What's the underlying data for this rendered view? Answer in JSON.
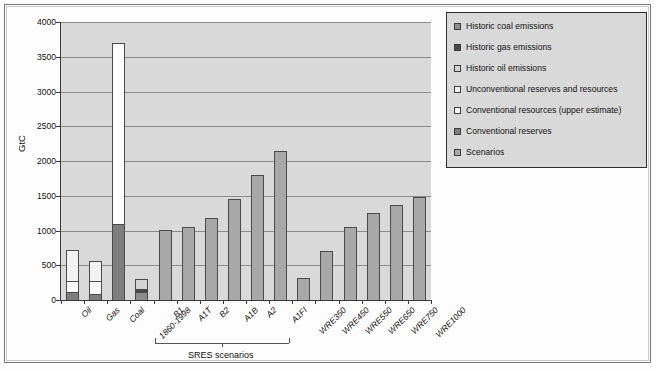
{
  "figure": {
    "axis_title": "GtC",
    "group_brace_label": "SRES scenarios"
  },
  "chart_data": {
    "type": "bar",
    "title": "",
    "xlabel": "",
    "ylabel": "GtC",
    "ylim": [
      0,
      4000
    ],
    "ytick_step": 500,
    "ytick_labels": [
      "4000",
      "3500",
      "3000",
      "2500",
      "2000",
      "1500",
      "1000",
      "500",
      "0"
    ],
    "grid": true,
    "stacked": true,
    "legend_position": "right",
    "legend": [
      {
        "label": "Historic coal emissions",
        "color": "#8c8c8c"
      },
      {
        "label": "Historic gas emissions",
        "color": "#4a4a4a"
      },
      {
        "label": "Historic oil emissions",
        "color": "#d4d4d4"
      },
      {
        "label": "Unconventional reserves and resources",
        "color": "#f2f2f2"
      },
      {
        "label": "Conventional resources (upper estimate)",
        "color": "#ffffff"
      },
      {
        "label": "Conventional reserves",
        "color": "#7e7e7e"
      },
      {
        "label": "Scenarios",
        "color": "#a8a8a8"
      }
    ],
    "categories": [
      "Oil",
      "Gas",
      "Coal",
      "1860-1998",
      "B1",
      "A1T",
      "B2",
      "A1B",
      "A2",
      "A1FI",
      "WRE350",
      "WRE450",
      "WRE550",
      "WRE650",
      "WRE750",
      "WRE1000"
    ],
    "bars": [
      {
        "category": "Oil",
        "total": 720,
        "segments": [
          {
            "series": "Conventional reserves",
            "from": 0,
            "to": 120,
            "value": 120,
            "color": "#7e7e7e"
          },
          {
            "series": "Conventional resources (upper estimate)",
            "from": 120,
            "to": 275,
            "value": 155,
            "color": "#ffffff"
          },
          {
            "series": "Unconventional reserves and resources",
            "from": 275,
            "to": 720,
            "value": 445,
            "color": "#f2f2f2"
          }
        ]
      },
      {
        "category": "Gas",
        "total": 560,
        "segments": [
          {
            "series": "Conventional reserves",
            "from": 0,
            "to": 90,
            "value": 90,
            "color": "#7e7e7e"
          },
          {
            "series": "Conventional resources (upper estimate)",
            "from": 90,
            "to": 270,
            "value": 180,
            "color": "#ffffff"
          },
          {
            "series": "Unconventional reserves and resources",
            "from": 270,
            "to": 560,
            "value": 290,
            "color": "#f2f2f2"
          }
        ]
      },
      {
        "category": "Coal",
        "total": 3700,
        "segments": [
          {
            "series": "Conventional reserves",
            "from": 0,
            "to": 1100,
            "value": 1100,
            "color": "#7e7e7e"
          },
          {
            "series": "Conventional resources (upper estimate)",
            "from": 1100,
            "to": 3700,
            "value": 2600,
            "color": "#ffffff"
          }
        ]
      },
      {
        "category": "1860-1998",
        "total": 305,
        "segments": [
          {
            "series": "Historic coal emissions",
            "from": 0,
            "to": 120,
            "value": 120,
            "color": "#8c8c8c"
          },
          {
            "series": "Historic gas emissions",
            "from": 120,
            "to": 160,
            "value": 40,
            "color": "#4a4a4a"
          },
          {
            "series": "Historic oil emissions",
            "from": 160,
            "to": 305,
            "value": 145,
            "color": "#d4d4d4"
          }
        ]
      },
      {
        "category": "B1",
        "total": 1005,
        "segments": [
          {
            "series": "Scenarios",
            "from": 0,
            "to": 1005,
            "value": 1005,
            "color": "#a8a8a8"
          }
        ]
      },
      {
        "category": "A1T",
        "total": 1050,
        "segments": [
          {
            "series": "Scenarios",
            "from": 0,
            "to": 1050,
            "value": 1050,
            "color": "#a8a8a8"
          }
        ]
      },
      {
        "category": "B2",
        "total": 1180,
        "segments": [
          {
            "series": "Scenarios",
            "from": 0,
            "to": 1180,
            "value": 1180,
            "color": "#a8a8a8"
          }
        ]
      },
      {
        "category": "A1B",
        "total": 1450,
        "segments": [
          {
            "series": "Scenarios",
            "from": 0,
            "to": 1450,
            "value": 1450,
            "color": "#a8a8a8"
          }
        ]
      },
      {
        "category": "A2",
        "total": 1800,
        "segments": [
          {
            "series": "Scenarios",
            "from": 0,
            "to": 1800,
            "value": 1800,
            "color": "#a8a8a8"
          }
        ]
      },
      {
        "category": "A1FI",
        "total": 2150,
        "segments": [
          {
            "series": "Scenarios",
            "from": 0,
            "to": 2150,
            "value": 2150,
            "color": "#a8a8a8"
          }
        ]
      },
      {
        "category": "WRE350",
        "total": 315,
        "segments": [
          {
            "series": "Scenarios",
            "from": 0,
            "to": 315,
            "value": 315,
            "color": "#a8a8a8"
          }
        ]
      },
      {
        "category": "WRE450",
        "total": 700,
        "segments": [
          {
            "series": "Scenarios",
            "from": 0,
            "to": 700,
            "value": 700,
            "color": "#a8a8a8"
          }
        ]
      },
      {
        "category": "WRE550",
        "total": 1050,
        "segments": [
          {
            "series": "Scenarios",
            "from": 0,
            "to": 1050,
            "value": 1050,
            "color": "#a8a8a8"
          }
        ]
      },
      {
        "category": "WRE650",
        "total": 1250,
        "segments": [
          {
            "series": "Scenarios",
            "from": 0,
            "to": 1250,
            "value": 1250,
            "color": "#a8a8a8"
          }
        ]
      },
      {
        "category": "WRE750",
        "total": 1370,
        "segments": [
          {
            "series": "Scenarios",
            "from": 0,
            "to": 1370,
            "value": 1370,
            "color": "#a8a8a8"
          }
        ]
      },
      {
        "category": "WRE1000",
        "total": 1480,
        "segments": [
          {
            "series": "Scenarios",
            "from": 0,
            "to": 1480,
            "value": 1480,
            "color": "#a8a8a8"
          }
        ]
      }
    ],
    "annotations": [
      {
        "text": "SRES scenarios",
        "spans": [
          "B1",
          "A1FI"
        ],
        "type": "brace"
      }
    ]
  }
}
